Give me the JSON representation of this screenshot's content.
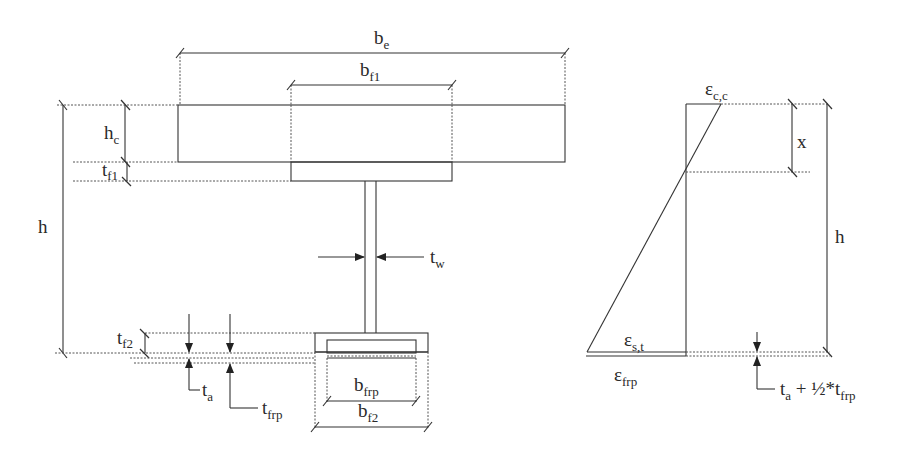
{
  "diagram": {
    "cross_section": {
      "labels": {
        "be": {
          "base": "b",
          "sub": "e"
        },
        "bf1": {
          "base": "b",
          "sub": "f1"
        },
        "hc": {
          "base": "h",
          "sub": "c"
        },
        "tf1": {
          "base": "t",
          "sub": "f1"
        },
        "h": {
          "base": "h",
          "sub": ""
        },
        "tw": {
          "base": "t",
          "sub": "w"
        },
        "tf2": {
          "base": "t",
          "sub": "f2"
        },
        "ta": {
          "base": "t",
          "sub": "a"
        },
        "tfrp": {
          "base": "t",
          "sub": "frp"
        },
        "bfrp": {
          "base": "b",
          "sub": "frp"
        },
        "bf2": {
          "base": "b",
          "sub": "f2"
        }
      },
      "components": [
        "concrete slab",
        "top steel flange",
        "steel web",
        "bottom steel flange",
        "adhesive layer",
        "FRP plate"
      ]
    },
    "strain_diagram": {
      "labels": {
        "ecc": {
          "base": "ε",
          "sub": "c,c"
        },
        "x": {
          "base": "x",
          "sub": ""
        },
        "h": {
          "base": "h",
          "sub": ""
        },
        "est": {
          "base": "ε",
          "sub": "s,t"
        },
        "efrp": {
          "base": "ε",
          "sub": "frp"
        },
        "offset": {
          "base": "t",
          "sub": "a",
          "rest": " + ½*t",
          "sub2": "frp"
        }
      }
    }
  }
}
